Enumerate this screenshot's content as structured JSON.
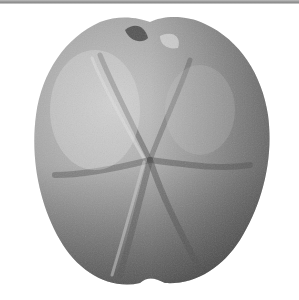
{
  "image": {
    "subject": "fossil echinoid (sea urchin) test, aboral view",
    "style": "grayscale photograph on white background",
    "colors": {
      "background": "#ffffff",
      "specimen_light": "#c8c8c8",
      "specimen_mid": "#8f8f8f",
      "specimen_dark": "#555555"
    }
  }
}
